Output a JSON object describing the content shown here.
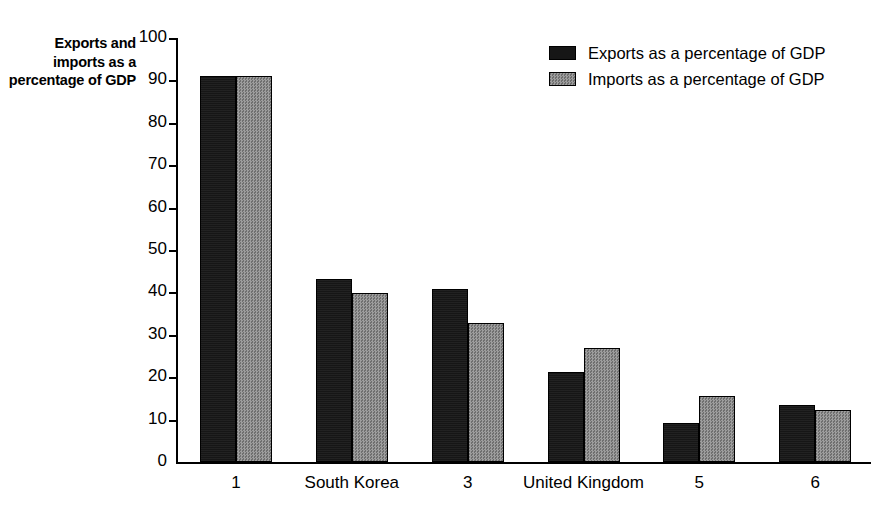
{
  "chart_data": {
    "type": "bar",
    "title": "",
    "subtitle": "",
    "xlabel": "",
    "ylabel": "Exports and imports as a percentage of GDP",
    "ylim": [
      0,
      100
    ],
    "yticks": [
      0,
      10,
      20,
      30,
      40,
      50,
      60,
      70,
      80,
      90,
      100
    ],
    "ytick_labels": [
      "0",
      "10",
      "20",
      "30",
      "40",
      "50",
      "60",
      "70",
      "80",
      "90",
      "100"
    ],
    "grid": false,
    "legend_position": "top-right",
    "categories": [
      "1",
      "South Korea",
      "3",
      "United Kingdom",
      "5",
      "6"
    ],
    "series": [
      {
        "name": "Exports as a percentage of GDP",
        "color": "#161616",
        "values": [
          91,
          43.2,
          40.8,
          21.2,
          9.3,
          13.5
        ]
      },
      {
        "name": "Imports as a percentage of GDP",
        "color": "#8e8e8e",
        "values": [
          91,
          39.9,
          32.7,
          26.8,
          15.5,
          12.3
        ]
      }
    ]
  },
  "legend": {
    "entries": [
      {
        "label": "Exports as a percentage of GDP",
        "swatch": "exports"
      },
      {
        "label": "Imports as a percentage of GDP",
        "swatch": "imports"
      }
    ]
  }
}
